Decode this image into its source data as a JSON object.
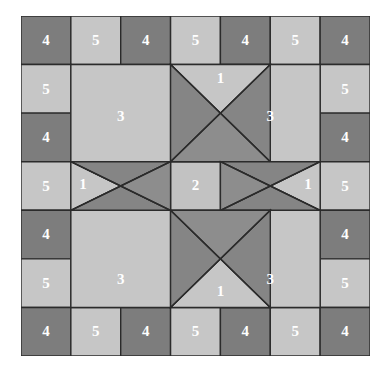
{
  "figure": {
    "kind": "quilt-block-diagram",
    "name": "Eight-Pointed Star Quilt Block",
    "background_color": "#ffffff",
    "outline_color": "#2b2b2b",
    "outline_width": 1.4,
    "grid": {
      "columns": 7,
      "rows": 7,
      "cell_width": 49.857,
      "cell_height": 48.571
    }
  },
  "palette": {
    "light": "#c6c6c6",
    "light_alt": "#c2c2c2",
    "mid": "#8d8d8d",
    "dark": "#7d7d7d",
    "dark_alt": "#858585",
    "line": "#2b2b2b",
    "label": "#ffffff"
  },
  "legend": {
    "pieces": [
      {
        "id": "1",
        "label": "1",
        "name": "star-point-hourglass",
        "count": 4,
        "shape": "quarter-square-triangle",
        "colors": [
          "#c6c6c6",
          "#858585"
        ]
      },
      {
        "id": "2",
        "label": "2",
        "name": "center-square",
        "count": 1,
        "shape": "square",
        "colors": [
          "#c2c2c2"
        ]
      },
      {
        "id": "3",
        "label": "3",
        "name": "corner-square",
        "count": 4,
        "shape": "square",
        "colors": [
          "#c6c6c6"
        ]
      },
      {
        "id": "4",
        "label": "4",
        "name": "border-dark-square",
        "count": 16,
        "shape": "square",
        "colors": [
          "#7d7d7d"
        ]
      },
      {
        "id": "5",
        "label": "5",
        "name": "border-light-square",
        "count": 12,
        "shape": "square",
        "colors": [
          "#c6c6c6"
        ]
      }
    ]
  },
  "patches": [
    {
      "name": "border-square-r0c0",
      "piece": "4",
      "label": "4",
      "fill": "#7d7d7d",
      "points": "0,0 49.857,0 49.857,48.571 0,48.571",
      "label_x": 24.93,
      "label_y": 25.5
    },
    {
      "name": "border-square-r0c1",
      "piece": "5",
      "label": "5",
      "fill": "#c6c6c6",
      "points": "49.857,0 99.714,0 99.714,48.571 49.857,48.571",
      "label_x": 74.79,
      "label_y": 25.5
    },
    {
      "name": "border-square-r0c2",
      "piece": "4",
      "label": "4",
      "fill": "#7d7d7d",
      "points": "99.714,0 149.571,0 149.571,48.571 99.714,48.571",
      "label_x": 124.64,
      "label_y": 25.5
    },
    {
      "name": "border-square-r0c3",
      "piece": "5",
      "label": "5",
      "fill": "#c6c6c6",
      "points": "149.571,0 199.428,0 199.428,48.571 149.571,48.571",
      "label_x": 174.5,
      "label_y": 25.5
    },
    {
      "name": "border-square-r0c4",
      "piece": "4",
      "label": "4",
      "fill": "#7d7d7d",
      "points": "199.428,0 249.285,0 249.285,48.571 199.428,48.571",
      "label_x": 224.36,
      "label_y": 25.5
    },
    {
      "name": "border-square-r0c5",
      "piece": "5",
      "label": "5",
      "fill": "#c6c6c6",
      "points": "249.285,0 299.142,0 299.142,48.571 249.285,48.571",
      "label_x": 274.21,
      "label_y": 25.5
    },
    {
      "name": "border-square-r0c6",
      "piece": "4",
      "label": "4",
      "fill": "#7d7d7d",
      "points": "299.142,0 349,0 349,48.571 299.142,48.571",
      "label_x": 324.07,
      "label_y": 25.5
    },
    {
      "name": "border-square-r1c0",
      "piece": "5",
      "label": "5",
      "fill": "#c6c6c6",
      "points": "0,48.571 49.857,48.571 49.857,97.142 0,97.142",
      "label_x": 24.93,
      "label_y": 74.07
    },
    {
      "name": "border-square-r1c6",
      "piece": "5",
      "label": "5",
      "fill": "#c6c6c6",
      "points": "299.142,48.571 349,48.571 349,97.142 299.142,97.142",
      "label_x": 324.07,
      "label_y": 74.07
    },
    {
      "name": "border-square-r2c0",
      "piece": "4",
      "label": "4",
      "fill": "#7d7d7d",
      "points": "0,97.142 49.857,97.142 49.857,145.713 0,145.713",
      "label_x": 24.93,
      "label_y": 122.64
    },
    {
      "name": "border-square-r2c6",
      "piece": "4",
      "label": "4",
      "fill": "#7d7d7d",
      "points": "299.142,97.142 349,97.142 349,145.713 299.142,145.713",
      "label_x": 324.07,
      "label_y": 122.64
    },
    {
      "name": "border-square-r3c0",
      "piece": "5",
      "label": "5",
      "fill": "#c6c6c6",
      "points": "0,145.713 49.857,145.713 49.857,194.284 0,194.284",
      "label_x": 24.93,
      "label_y": 171.21
    },
    {
      "name": "border-square-r3c6",
      "piece": "5",
      "label": "5",
      "fill": "#c6c6c6",
      "points": "299.142,145.713 349,145.713 349,194.284 299.142,194.284",
      "label_x": 324.07,
      "label_y": 171.21
    },
    {
      "name": "border-square-r4c0",
      "piece": "4",
      "label": "4",
      "fill": "#7d7d7d",
      "points": "0,194.284 49.857,194.284 49.857,242.855 0,242.855",
      "label_x": 24.93,
      "label_y": 219.78
    },
    {
      "name": "border-square-r4c6",
      "piece": "4",
      "label": "4",
      "fill": "#7d7d7d",
      "points": "299.142,194.284 349,194.284 349,242.855 299.142,242.855",
      "label_x": 324.07,
      "label_y": 219.78
    },
    {
      "name": "border-square-r5c0",
      "piece": "5",
      "label": "5",
      "fill": "#c6c6c6",
      "points": "0,242.855 49.857,242.855 49.857,291.426 0,291.426",
      "label_x": 24.93,
      "label_y": 268.35
    },
    {
      "name": "border-square-r5c6",
      "piece": "5",
      "label": "5",
      "fill": "#c6c6c6",
      "points": "299.142,242.855 349,242.855 349,291.426 299.142,291.426",
      "label_x": 324.07,
      "label_y": 268.35
    },
    {
      "name": "border-square-r6c0",
      "piece": "4",
      "label": "4",
      "fill": "#7d7d7d",
      "points": "0,291.426 49.857,291.426 49.857,340 0,340",
      "label_x": 24.93,
      "label_y": 316.9
    },
    {
      "name": "border-square-r6c1",
      "piece": "5",
      "label": "5",
      "fill": "#c6c6c6",
      "points": "49.857,291.426 99.714,291.426 99.714,340 49.857,340",
      "label_x": 74.79,
      "label_y": 316.9
    },
    {
      "name": "border-square-r6c2",
      "piece": "4",
      "label": "4",
      "fill": "#7d7d7d",
      "points": "99.714,291.426 149.571,291.426 149.571,340 99.714,340",
      "label_x": 124.64,
      "label_y": 316.9
    },
    {
      "name": "border-square-r6c3",
      "piece": "5",
      "label": "5",
      "fill": "#c6c6c6",
      "points": "149.571,291.426 199.428,291.426 199.428,340 149.571,340",
      "label_x": 174.5,
      "label_y": 316.9
    },
    {
      "name": "border-square-r6c4",
      "piece": "4",
      "label": "4",
      "fill": "#7d7d7d",
      "points": "199.428,291.426 249.285,291.426 249.285,340 199.428,340",
      "label_x": 224.36,
      "label_y": 316.9
    },
    {
      "name": "border-square-r6c5",
      "piece": "5",
      "label": "5",
      "fill": "#c6c6c6",
      "points": "249.285,291.426 299.142,291.426 299.142,340 249.285,340",
      "label_x": 274.21,
      "label_y": 316.9
    },
    {
      "name": "border-square-r6c6",
      "piece": "4",
      "label": "4",
      "fill": "#7d7d7d",
      "points": "299.142,291.426 349,291.426 349,340 299.142,340",
      "label_x": 324.07,
      "label_y": 316.9
    },
    {
      "name": "corner-square-top-left",
      "piece": "3",
      "label": "3",
      "fill": "#c6c6c6",
      "points": "49.857,48.571 149.571,48.571 149.571,145.713 49.857,145.713",
      "label_x": 99.71,
      "label_y": 102.0
    },
    {
      "name": "corner-square-top-right",
      "piece": "3",
      "label": "3",
      "fill": "#c6c6c6",
      "points": "199.428,48.571 299.142,48.571 299.142,145.713 199.428,145.713",
      "label_x": 249.28,
      "label_y": 102.0
    },
    {
      "name": "corner-square-bottom-left",
      "piece": "3",
      "label": "3",
      "fill": "#c6c6c6",
      "points": "49.857,194.284 149.571,194.284 149.571,291.426 49.857,291.426",
      "label_x": 99.71,
      "label_y": 265.0
    },
    {
      "name": "corner-square-bottom-right",
      "piece": "3",
      "label": "3",
      "fill": "#c6c6c6",
      "points": "199.428,194.284 299.142,194.284 299.142,291.426 199.428,291.426",
      "label_x": 249.28,
      "label_y": 265.0
    },
    {
      "name": "center-square",
      "piece": "2",
      "label": "2",
      "fill": "#c2c2c2",
      "points": "149.571,145.713 199.428,145.713 199.428,194.284 149.571,194.284",
      "label_x": 174.5,
      "label_y": 171.0
    },
    {
      "name": "star-point-top-triangle-north",
      "piece": "1",
      "label": "1",
      "fill": "#c6c6c6",
      "points": "149.571,48.571 249.285,48.571 199.428,97.142",
      "label_x": 199.43,
      "label_y": 64.0
    },
    {
      "name": "star-point-top-triangle-west",
      "piece": "1",
      "label": "",
      "fill": "#858585",
      "points": "149.571,48.571 199.428,97.142 149.571,145.713",
      "label_x": 0,
      "label_y": 0
    },
    {
      "name": "star-point-top-triangle-east",
      "piece": "1",
      "label": "",
      "fill": "#858585",
      "points": "249.285,48.571 249.285,145.713 199.428,97.142",
      "label_x": 0,
      "label_y": 0
    },
    {
      "name": "star-point-top-triangle-south",
      "piece": "1",
      "label": "",
      "fill": "#8d8d8d",
      "points": "149.571,145.713 249.285,145.713 199.428,97.142",
      "label_x": 0,
      "label_y": 0
    },
    {
      "name": "star-point-left-triangle-west",
      "piece": "1",
      "label": "1",
      "fill": "#c6c6c6",
      "points": "49.857,145.713 99.714,170.0 49.857,194.284",
      "label_x": 62.0,
      "label_y": 170.0
    },
    {
      "name": "star-point-left-triangle-north",
      "piece": "1",
      "label": "",
      "fill": "#858585",
      "points": "49.857,145.713 149.571,145.713 99.714,170.0",
      "label_x": 0,
      "label_y": 0
    },
    {
      "name": "star-point-left-triangle-south",
      "piece": "1",
      "label": "",
      "fill": "#858585",
      "points": "49.857,194.284 149.571,194.284 99.714,170.0",
      "label_x": 0,
      "label_y": 0
    },
    {
      "name": "star-point-left-triangle-east",
      "piece": "1",
      "label": "",
      "fill": "#8d8d8d",
      "points": "149.571,145.713 149.571,194.284 99.714,170.0",
      "label_x": 0,
      "label_y": 0
    },
    {
      "name": "star-point-right-triangle-east",
      "piece": "1",
      "label": "1",
      "fill": "#c6c6c6",
      "points": "299.142,145.713 299.142,194.284 249.285,170.0",
      "label_x": 287.0,
      "label_y": 170.0
    },
    {
      "name": "star-point-right-triangle-north",
      "piece": "1",
      "label": "",
      "fill": "#858585",
      "points": "199.428,145.713 299.142,145.713 249.285,170.0",
      "label_x": 0,
      "label_y": 0
    },
    {
      "name": "star-point-right-triangle-south",
      "piece": "1",
      "label": "",
      "fill": "#858585",
      "points": "199.428,194.284 299.142,194.284 249.285,170.0",
      "label_x": 0,
      "label_y": 0
    },
    {
      "name": "star-point-right-triangle-west",
      "piece": "1",
      "label": "",
      "fill": "#8d8d8d",
      "points": "199.428,145.713 199.428,194.284 249.285,170.0",
      "label_x": 0,
      "label_y": 0
    },
    {
      "name": "star-point-bottom-triangle-south",
      "piece": "1",
      "label": "1",
      "fill": "#c6c6c6",
      "points": "149.571,291.426 249.285,291.426 199.428,242.855",
      "label_x": 199.43,
      "label_y": 277.0
    },
    {
      "name": "star-point-bottom-triangle-west",
      "piece": "1",
      "label": "",
      "fill": "#858585",
      "points": "149.571,194.284 149.571,291.426 199.428,242.855",
      "label_x": 0,
      "label_y": 0
    },
    {
      "name": "star-point-bottom-triangle-east",
      "piece": "1",
      "label": "",
      "fill": "#858585",
      "points": "249.285,194.284 249.285,291.426 199.428,242.855",
      "label_x": 0,
      "label_y": 0
    },
    {
      "name": "star-point-bottom-triangle-north",
      "piece": "1",
      "label": "",
      "fill": "#8d8d8d",
      "points": "149.571,194.284 249.285,194.284 199.428,242.855",
      "label_x": 0,
      "label_y": 0
    }
  ],
  "seam_lines": [
    {
      "name": "seam-top-star-diag-1",
      "x1": 149.571,
      "y1": 48.571,
      "x2": 249.285,
      "y2": 145.713
    },
    {
      "name": "seam-top-star-diag-2",
      "x1": 249.285,
      "y1": 48.571,
      "x2": 149.571,
      "y2": 145.713
    },
    {
      "name": "seam-bottom-star-diag-1",
      "x1": 149.571,
      "y1": 194.284,
      "x2": 249.285,
      "y2": 291.426
    },
    {
      "name": "seam-bottom-star-diag-2",
      "x1": 249.285,
      "y1": 194.284,
      "x2": 149.571,
      "y2": 291.426
    },
    {
      "name": "seam-left-star-diag-1",
      "x1": 49.857,
      "y1": 145.713,
      "x2": 149.571,
      "y2": 194.284
    },
    {
      "name": "seam-left-star-diag-2",
      "x1": 49.857,
      "y1": 194.284,
      "x2": 149.571,
      "y2": 145.713
    },
    {
      "name": "seam-right-star-diag-1",
      "x1": 199.428,
      "y1": 145.713,
      "x2": 299.142,
      "y2": 194.284
    },
    {
      "name": "seam-right-star-diag-2",
      "x1": 199.428,
      "y1": 194.284,
      "x2": 299.142,
      "y2": 145.713
    }
  ]
}
